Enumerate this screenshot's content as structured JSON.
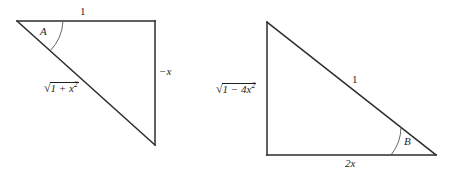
{
  "figure": {
    "background_color": "#ffffff",
    "line_color": "#2b2b2b",
    "arc_color": "#555555",
    "triangles": [
      {
        "id": "left-triangle",
        "vertices": {
          "top_left": [
            17,
            21
          ],
          "top_right": [
            155,
            21
          ],
          "bottom_right": [
            155,
            145
          ]
        },
        "labels": {
          "top_side": "1",
          "angle": "A",
          "hypotenuse_radicand": "1 + x",
          "hypotenuse_exponent": "2",
          "vertical_side": "−x"
        }
      },
      {
        "id": "right-triangle",
        "vertices": {
          "top_left": [
            267,
            22
          ],
          "bottom_left": [
            267,
            155
          ],
          "bottom_right": [
            436,
            155
          ]
        },
        "labels": {
          "vertical_side_radicand": "1 − 4x",
          "vertical_side_exponent": "2",
          "hypotenuse": "1",
          "base_side": "2x",
          "angle": "B"
        }
      }
    ],
    "symbols": {
      "radical_sign": "√",
      "minus_sign": "−"
    }
  }
}
